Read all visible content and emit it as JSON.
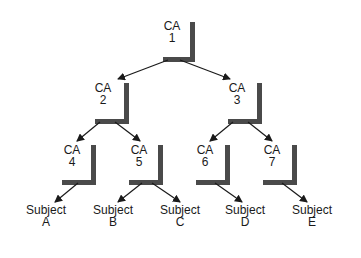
{
  "diagram": {
    "colors": {
      "bar": "#4a4a4a",
      "line": "#1a1a1a",
      "background": "#ffffff"
    },
    "nodes": [
      {
        "id": "ca1",
        "title": "CA",
        "sub": "1",
        "x": 172,
        "y": 26
      },
      {
        "id": "ca2",
        "title": "CA",
        "sub": "2",
        "x": 103,
        "y": 88
      },
      {
        "id": "ca3",
        "title": "CA",
        "sub": "3",
        "x": 237,
        "y": 88
      },
      {
        "id": "ca4",
        "title": "CA",
        "sub": "4",
        "x": 72,
        "y": 150
      },
      {
        "id": "ca5",
        "title": "CA",
        "sub": "5",
        "x": 139,
        "y": 150
      },
      {
        "id": "ca6",
        "title": "CA",
        "sub": "6",
        "x": 205,
        "y": 150
      },
      {
        "id": "ca7",
        "title": "CA",
        "sub": "7",
        "x": 272,
        "y": 150
      },
      {
        "id": "subjA",
        "title": "Subject",
        "sub": "A",
        "x": 46,
        "y": 210
      },
      {
        "id": "subjB",
        "title": "Subject",
        "sub": "B",
        "x": 113,
        "y": 210
      },
      {
        "id": "subjC",
        "title": "Subject",
        "sub": "C",
        "x": 180,
        "y": 210
      },
      {
        "id": "subjD",
        "title": "Subject",
        "sub": "D",
        "x": 245,
        "y": 210
      },
      {
        "id": "subjE",
        "title": "Subject",
        "sub": "E",
        "x": 312,
        "y": 210
      }
    ],
    "edges": [
      [
        "ca1",
        "ca2"
      ],
      [
        "ca1",
        "ca3"
      ],
      [
        "ca2",
        "ca4"
      ],
      [
        "ca2",
        "ca5"
      ],
      [
        "ca3",
        "ca6"
      ],
      [
        "ca3",
        "ca7"
      ],
      [
        "ca4",
        "subjA"
      ],
      [
        "ca5",
        "subjB"
      ],
      [
        "ca5",
        "subjC"
      ],
      [
        "ca6",
        "subjD"
      ],
      [
        "ca7",
        "subjE"
      ]
    ]
  }
}
